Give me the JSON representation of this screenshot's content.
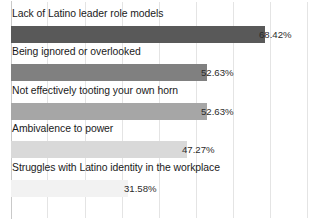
{
  "chart_data": {
    "type": "bar",
    "orientation": "horizontal",
    "title": "",
    "subtitle": "",
    "xlabel": "",
    "ylabel": "",
    "xlim": [
      0,
      80
    ],
    "grid": true,
    "legend": false,
    "categories": [
      "Lack of Latino leader role models",
      "Being ignored or overlooked",
      "Not effectively tooting your own horn",
      "Ambivalence to power",
      "Struggles with Latino identity in the workplace"
    ],
    "values": [
      68.42,
      52.63,
      52.63,
      47.27,
      31.58
    ],
    "value_labels": [
      "68.42%",
      "52.63%",
      "52.63%",
      "47.27%",
      "31.58%"
    ],
    "bar_colors": [
      "#595959",
      "#808080",
      "#a6a6a6",
      "#d9d9d9",
      "#f2f2f2"
    ],
    "gridline_color": "#e4e4e4",
    "axis_color": "#c9c9c9",
    "background": "#ffffff"
  },
  "bars": [
    {
      "label": "Lack of Latino leader role models",
      "value_label": "68.42%",
      "value": 68.42,
      "color": "#595959",
      "label_top": 7,
      "bar_top": 26,
      "bar_width": 254,
      "value_left": 259
    },
    {
      "label": "Being ignored or overlooked",
      "value_label": "52.63%",
      "value": 52.63,
      "color": "#808080",
      "label_top": 45,
      "bar_top": 64,
      "bar_width": 196,
      "value_left": 201
    },
    {
      "label": "Not effectively tooting your own horn",
      "value_label": "52.63%",
      "value": 52.63,
      "color": "#a6a6a6",
      "label_top": 84,
      "bar_top": 103,
      "bar_width": 196,
      "value_left": 201
    },
    {
      "label": "Ambivalence to power",
      "value_label": "47.27%",
      "value": 47.27,
      "color": "#d9d9d9",
      "label_top": 122,
      "bar_top": 141,
      "bar_width": 176,
      "value_left": 182
    },
    {
      "label": "Struggles with Latino identity in the workplace",
      "value_label": "31.58%",
      "value": 31.58,
      "color": "#f2f2f2",
      "label_top": 161,
      "bar_top": 180,
      "bar_width": 117,
      "value_left": 124
    }
  ],
  "gridlines": [
    {
      "x": 11,
      "axis": true
    },
    {
      "x": 47,
      "axis": false
    },
    {
      "x": 85,
      "axis": false
    },
    {
      "x": 122,
      "axis": false
    },
    {
      "x": 159,
      "axis": false
    },
    {
      "x": 196,
      "axis": false
    },
    {
      "x": 233,
      "axis": false
    },
    {
      "x": 270,
      "axis": false
    },
    {
      "x": 307,
      "axis": false
    }
  ]
}
